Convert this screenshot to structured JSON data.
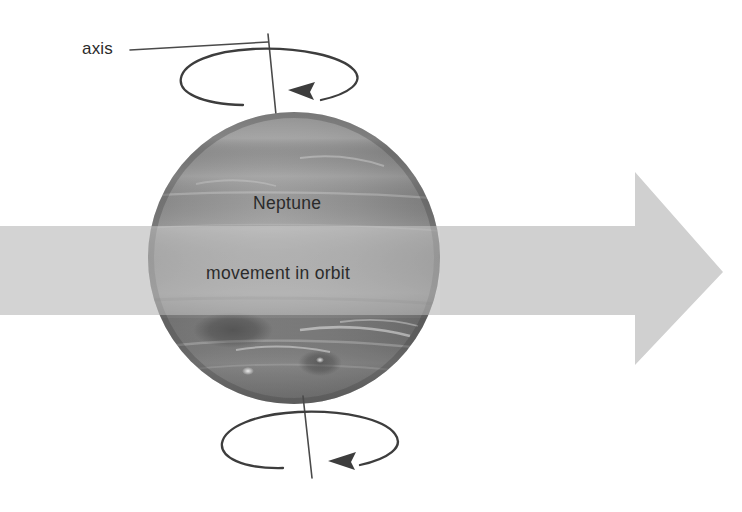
{
  "figure": {
    "background_color": "#ffffff"
  },
  "labels": {
    "axis": "axis",
    "planet_name": "Neptune",
    "orbit_motion": "movement in orbit"
  },
  "colors": {
    "ink": "#3d3d3d",
    "leader_line": "#4a4a4a",
    "orbit_arrow": "#d0d0d0",
    "planet_dark": "#6f6f6f",
    "planet_mid": "#8a8a8a",
    "planet_light": "#a6a6a6",
    "text": "#2b2b2b"
  },
  "diagram": {
    "planet": {
      "name": "Neptune",
      "center_x": 294,
      "center_y": 258,
      "radius": 146,
      "features": [
        "great-dark-spot",
        "small-dark-spot",
        "cloud-bands",
        "bright-streaks"
      ]
    },
    "axis_line": {
      "label": "axis",
      "top_x": 268,
      "top_y": 34,
      "bottom_x": 312,
      "bottom_y": 478
    },
    "rotation_arrows": [
      {
        "position": "top",
        "direction": "counterclockwise-from-above",
        "cx": 268,
        "cy": 78,
        "rx": 88,
        "ry": 27
      },
      {
        "position": "bottom",
        "direction": "counterclockwise-from-above",
        "cx": 309,
        "cy": 441,
        "rx": 87,
        "ry": 29
      }
    ],
    "orbit_arrow": {
      "label": "movement in orbit",
      "direction": "right",
      "band_left_x": 0,
      "band_top_y": 226,
      "band_bottom_y": 315,
      "head_start_x": 635,
      "head_top_y": 172,
      "head_bottom_y": 365,
      "tip_x": 723,
      "tip_y": 272
    }
  }
}
